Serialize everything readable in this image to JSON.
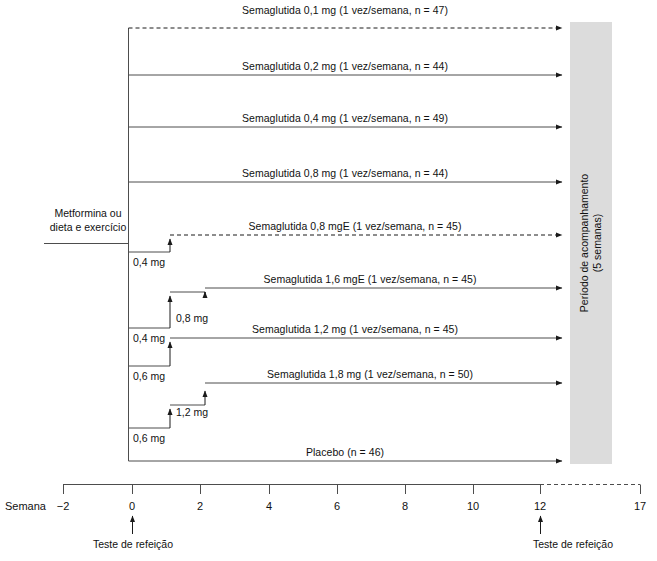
{
  "figure": {
    "type": "clinical-trial-design-diagram",
    "language": "pt-BR",
    "background_entry": {
      "line1": "Metformina ou",
      "line2": "dieta e exercício"
    },
    "followup_box": {
      "line1": "Período de acompanhamento",
      "line2": "(5 semanas)",
      "fill_color": "#dcdcdc",
      "start_week": 12,
      "end_week": 17
    },
    "axis": {
      "name": "Semana",
      "ticks": [
        "−2",
        "0",
        "2",
        "4",
        "6",
        "8",
        "10",
        "12",
        "17"
      ],
      "tick_weeks": [
        -2,
        0,
        2,
        4,
        6,
        8,
        10,
        12,
        17
      ],
      "solid_until_week": 12,
      "dashed_from_week": 12
    },
    "meal_tests": [
      {
        "label": "Teste de refeição",
        "week": 0
      },
      {
        "label": "Teste de refeição",
        "week": 12
      }
    ],
    "arms": [
      {
        "label": "Semaglutida 0,1 mg (1 vez/semana, n = 47)",
        "drug": "Semaglutida",
        "dose": "0,1 mg",
        "frequency": "1 vez/semana",
        "n": 47,
        "line_style": "dashed",
        "start_week": 0,
        "escalation_steps": []
      },
      {
        "label": "Semaglutida 0,2 mg (1 vez/semana, n = 44)",
        "drug": "Semaglutida",
        "dose": "0,2 mg",
        "frequency": "1 vez/semana",
        "n": 44,
        "line_style": "solid",
        "start_week": 0,
        "escalation_steps": []
      },
      {
        "label": "Semaglutida 0,4 mg (1 vez/semana, n = 49)",
        "drug": "Semaglutida",
        "dose": "0,4 mg",
        "frequency": "1 vez/semana",
        "n": 49,
        "line_style": "solid",
        "start_week": 0,
        "escalation_steps": []
      },
      {
        "label": "Semaglutida 0,8 mg (1 vez/semana, n = 44)",
        "drug": "Semaglutida",
        "dose": "0,8 mg",
        "frequency": "1 vez/semana",
        "n": 44,
        "line_style": "solid",
        "start_week": 0,
        "escalation_steps": []
      },
      {
        "label": "Semaglutida 0,8 mgE (1 vez/semana, n = 45)",
        "drug": "Semaglutida",
        "dose": "0,8 mgE",
        "frequency": "1 vez/semana",
        "n": 45,
        "line_style": "dashed",
        "start_week": 1,
        "escalation_steps": [
          {
            "dose": "0,4 mg",
            "start_week": 0
          }
        ]
      },
      {
        "label": "Semaglutida 1,6 mgE (1 vez/semana, n = 45)",
        "drug": "Semaglutida",
        "dose": "1,6 mgE",
        "frequency": "1 vez/semana",
        "n": 45,
        "line_style": "solid",
        "start_week": 2,
        "escalation_steps": [
          {
            "dose": "0,4 mg",
            "start_week": 0
          },
          {
            "dose": "0,8 mg",
            "start_week": 1
          }
        ]
      },
      {
        "label": "Semaglutida 1,2 mg (1 vez/semana, n = 45)",
        "drug": "Semaglutida",
        "dose": "1,2 mg",
        "frequency": "1 vez/semana",
        "n": 45,
        "line_style": "solid",
        "start_week": 1,
        "escalation_steps": [
          {
            "dose": "0,6 mg",
            "start_week": 0
          }
        ]
      },
      {
        "label": "Semaglutida 1,8 mg (1 vez/semana, n = 50)",
        "drug": "Semaglutida",
        "dose": "1,8 mg",
        "frequency": "1 vez/semana",
        "n": 50,
        "line_style": "solid",
        "start_week": 2,
        "escalation_steps": [
          {
            "dose": "0,6 mg",
            "start_week": 0
          },
          {
            "dose": "1,2 mg",
            "start_week": 1
          }
        ]
      },
      {
        "label": "Placebo (n = 46)",
        "drug": "Placebo",
        "dose": "",
        "frequency": "",
        "n": 46,
        "line_style": "solid",
        "start_week": 0,
        "escalation_steps": []
      }
    ],
    "dose_annotations": [
      {
        "text": "0,4 mg",
        "x": 133,
        "y": 256
      },
      {
        "text": "0,8 mg",
        "x": 176,
        "y": 312
      },
      {
        "text": "0,4 mg",
        "x": 133,
        "y": 332
      },
      {
        "text": "0,6 mg",
        "x": 133,
        "y": 370
      },
      {
        "text": "1,2 mg",
        "x": 176,
        "y": 406
      },
      {
        "text": "0,6 mg",
        "x": 133,
        "y": 432
      }
    ]
  }
}
